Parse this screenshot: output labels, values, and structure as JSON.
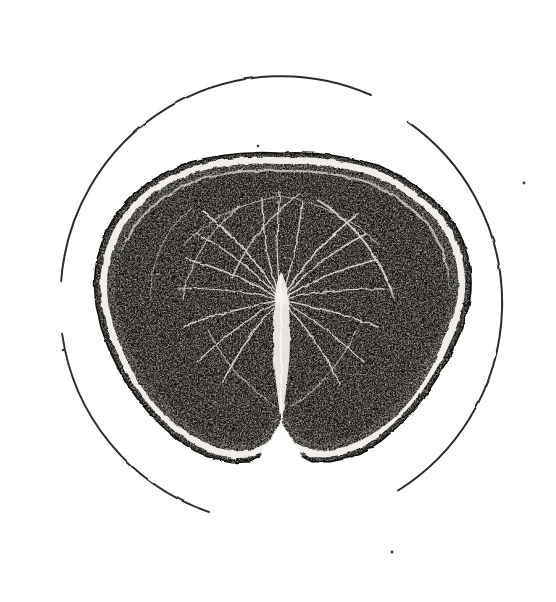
{
  "figure": {
    "caption": "Fig.I.",
    "caption_parts": {
      "lead": "F",
      "smallcaps": "IG",
      "tail": ".I."
    },
    "title": "Fig.I.",
    "medium": "engraving",
    "background_color": "#ffffff",
    "ink_color": "#17150f",
    "line_color": "#2f2b26"
  },
  "field_circle": {
    "name": "microscope-field-outline",
    "center_x": 281,
    "center_y": 303,
    "radius": 221,
    "stroke_color": "#2f2b26",
    "stroke_width": 2.0,
    "style": "broken-arc",
    "arcs": [
      {
        "label": "top-arc",
        "start_deg": 186,
        "end_deg": 294
      },
      {
        "label": "right-arc",
        "start_deg": 305,
        "end_deg": 58
      },
      {
        "label": "bottom-left-arc",
        "start_deg": 109,
        "end_deg": 172
      }
    ],
    "gaps": [
      {
        "label": "upper-right-gap",
        "start_deg": 294,
        "end_deg": 305
      },
      {
        "label": "lower-left-gap",
        "start_deg": 172,
        "end_deg": 186
      },
      {
        "label": "bottom-gap",
        "start_deg": 58,
        "end_deg": 109
      }
    ]
  },
  "specimen": {
    "name": "spinal-cord-section",
    "bounds": {
      "x": 92,
      "y": 152,
      "width": 380,
      "height": 312
    },
    "fill_color": "#151210",
    "outline_color": "#0d0b09",
    "rim": {
      "name": "pia-mater-rim",
      "description": "layered outer border with pale band beneath dark margin",
      "band_color": "#efece6"
    },
    "central_fissure": {
      "name": "posterior-median-fissure",
      "description": "bright vertical cleft descending from upper centre",
      "color": "#f4f1eb",
      "top_x": 276,
      "top_y": 290,
      "bottom_x": 281,
      "bottom_y": 424
    },
    "bottom_notch": {
      "name": "anterior-median-fissure",
      "description": "V-shaped notch indenting the lower margin",
      "x": 281,
      "y": 462
    },
    "striations": {
      "name": "radiating-white-fibre-striations",
      "count": 26,
      "color": "#e8e4dc"
    },
    "stipple": {
      "name": "engraved-stipple-texture",
      "dot_count": 2300,
      "dot_color": "#ece8e0"
    },
    "lobes": [
      {
        "label": "left-lateral-lobe",
        "x": 96,
        "y": 300
      },
      {
        "label": "right-lateral-lobe",
        "x": 466,
        "y": 300
      }
    ]
  },
  "specks": [
    {
      "name": "paper-speck-top",
      "x": 258,
      "y": 146,
      "r": 1.3
    },
    {
      "name": "paper-speck-right",
      "x": 524,
      "y": 183,
      "r": 1.4
    },
    {
      "name": "paper-speck-left",
      "x": 63,
      "y": 350,
      "r": 1.2
    },
    {
      "name": "paper-speck-mid",
      "x": 449,
      "y": 303,
      "r": 1.1
    },
    {
      "name": "paper-speck-bottom",
      "x": 392,
      "y": 552,
      "r": 1.5
    }
  ]
}
